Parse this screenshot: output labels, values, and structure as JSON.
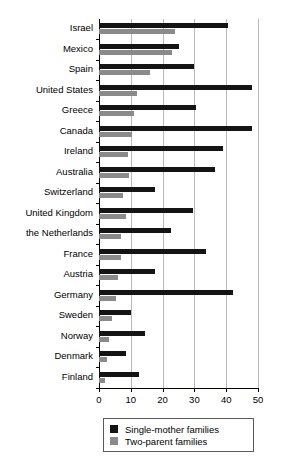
{
  "chart_data": {
    "type": "bar",
    "orientation": "horizontal",
    "title": "Poverty rates",
    "xlabel": "",
    "ylabel": "",
    "xlim": [
      0,
      50
    ],
    "xticks": [
      0,
      10,
      20,
      30,
      40,
      50
    ],
    "xtick_labels": [
      "0",
      "10",
      "20",
      "30",
      "40",
      "50"
    ],
    "grid": "vertical",
    "legend_position": "bottom",
    "colors": {
      "single_mother": "#141414",
      "two_parent": "#8a8a8a",
      "gridline": "#b9b9b9",
      "axis": "#000000",
      "background": "#ffffff"
    },
    "categories": [
      "Israel",
      "Mexico",
      "Spain",
      "United States",
      "Greece",
      "Canada",
      "Ireland",
      "Australia",
      "Switzerland",
      "United Kingdom",
      "the Netherlands",
      "France",
      "Austria",
      "Germany",
      "Sweden",
      "Norway",
      "Denmark",
      "Finland"
    ],
    "series": [
      {
        "name": "Single-mother families",
        "color": "#141414",
        "values": [
          40.5,
          25,
          30,
          48,
          30.5,
          48,
          39,
          36.5,
          17.5,
          29.5,
          22.5,
          33.5,
          17.5,
          42,
          10,
          14.5,
          8.5,
          12.5
        ]
      },
      {
        "name": "Two-parent families",
        "color": "#8a8a8a",
        "values": [
          24,
          23,
          16,
          12,
          11,
          10.5,
          9,
          9.5,
          7.5,
          8.5,
          7,
          7,
          6,
          5.5,
          4,
          3,
          2.5,
          2
        ]
      }
    ]
  },
  "legend": {
    "items": [
      {
        "label": "Single-mother families",
        "color": "#141414"
      },
      {
        "label": "Two-parent families",
        "color": "#8a8a8a"
      }
    ]
  }
}
